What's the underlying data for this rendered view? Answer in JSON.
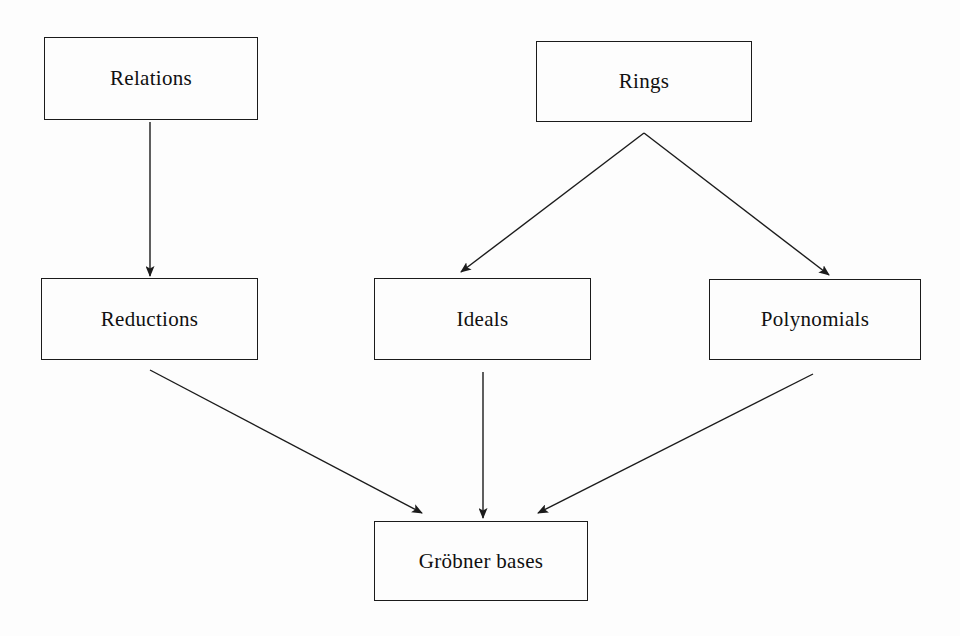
{
  "diagram": {
    "background_color": "#fdfdfd",
    "line_color": "#1b1b1b",
    "text_color": "#101010",
    "nodes": [
      {
        "id": "relations",
        "label": "Relations",
        "x": 44,
        "y": 37,
        "w": 214,
        "h": 83
      },
      {
        "id": "rings",
        "label": "Rings",
        "x": 536,
        "y": 41,
        "w": 216,
        "h": 81
      },
      {
        "id": "reductions",
        "label": "Reductions",
        "x": 41,
        "y": 278,
        "w": 217,
        "h": 82
      },
      {
        "id": "ideals",
        "label": "Ideals",
        "x": 374,
        "y": 278,
        "w": 217,
        "h": 82
      },
      {
        "id": "polynomials",
        "label": "Polynomials",
        "x": 709,
        "y": 279,
        "w": 212,
        "h": 81
      },
      {
        "id": "grobner",
        "label": "Gröbner bases",
        "x": 374,
        "y": 521,
        "w": 214,
        "h": 80
      }
    ],
    "edges": [
      {
        "id": "relations-to-reductions",
        "from": "relations",
        "to": "reductions",
        "kind": "straight-arrow"
      },
      {
        "id": "rings-to-ideals",
        "from": "rings",
        "to": "ideals",
        "kind": "straight-arrow"
      },
      {
        "id": "rings-to-polynomials",
        "from": "rings",
        "to": "polynomials",
        "kind": "straight-arrow"
      },
      {
        "id": "reductions-to-grobner",
        "from": "reductions",
        "to": "grobner",
        "kind": "straight-arrow"
      },
      {
        "id": "ideals-to-grobner",
        "from": "ideals",
        "to": "grobner",
        "kind": "straight-arrow"
      },
      {
        "id": "polynomials-to-grobner",
        "from": "polynomials",
        "to": "grobner",
        "kind": "straight-arrow"
      }
    ]
  }
}
